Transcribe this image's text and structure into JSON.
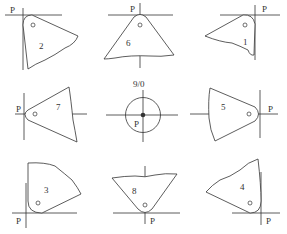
{
  "diagram": {
    "point_label": "P",
    "center_label": "9/0",
    "positions": [
      {
        "code": "2",
        "location": "top-left",
        "label": "2",
        "p_label": "P"
      },
      {
        "code": "6",
        "location": "top-center",
        "label": "6",
        "p_label": "P"
      },
      {
        "code": "1",
        "location": "top-right",
        "label": "1",
        "p_label": "P"
      },
      {
        "code": "7",
        "location": "middle-left",
        "label": "7",
        "p_label": "P"
      },
      {
        "code": "9/0",
        "location": "center",
        "label": "9/0",
        "p_label": "P"
      },
      {
        "code": "5",
        "location": "middle-right",
        "label": "5",
        "p_label": "P"
      },
      {
        "code": "3",
        "location": "bottom-left",
        "label": "3",
        "p_label": "P"
      },
      {
        "code": "8",
        "location": "bottom-center",
        "label": "8",
        "p_label": "P"
      },
      {
        "code": "4",
        "location": "bottom-right",
        "label": "4",
        "p_label": "P"
      }
    ]
  }
}
